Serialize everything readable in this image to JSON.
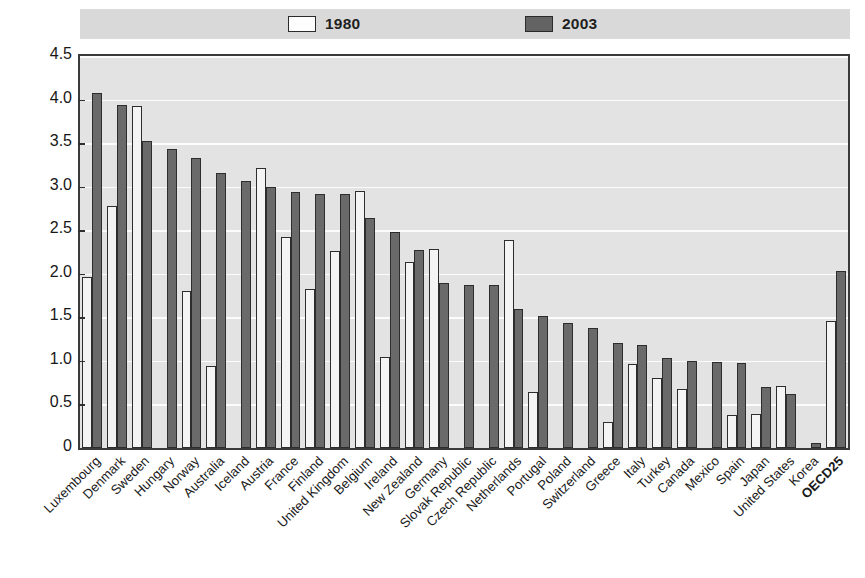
{
  "legend": {
    "entries": [
      {
        "label": "1980",
        "key": "1980",
        "swatch": "legend-swatch-outline",
        "color": "#fdfdfd"
      },
      {
        "label": "2003",
        "key": "2003",
        "swatch": "legend-swatch-filled",
        "color": "#636363"
      }
    ]
  },
  "chart_data": {
    "type": "bar",
    "title": "",
    "subtitle": "",
    "xlabel": "",
    "ylabel": "",
    "ylim": [
      0,
      4.5
    ],
    "yticks": [
      "0",
      "0.5",
      "1.0",
      "1.5",
      "2.0",
      "2.5",
      "3.0",
      "3.5",
      "4.0",
      "4.5"
    ],
    "ytick_values": [
      0,
      0.5,
      1.0,
      1.5,
      2.0,
      2.5,
      3.0,
      3.5,
      4.0,
      4.5
    ],
    "grid": true,
    "grid_axis": "y",
    "legend_position": "top",
    "categories": [
      "Luxembourg",
      "Denmark",
      "Sweden",
      "Hungary",
      "Norway",
      "Australia",
      "Iceland",
      "Austria",
      "France",
      "Finland",
      "United Kingdom",
      "Belgium",
      "Ireland",
      "New Zealand",
      "Germany",
      "Slovak Republic",
      "Czech Republic",
      "Netherlands",
      "Portugal",
      "Poland",
      "Switzerland",
      "Greece",
      "Italy",
      "Turkey",
      "Canada",
      "Mexico",
      "Spain",
      "Japan",
      "United States",
      "Korea",
      "OECD25"
    ],
    "series": [
      {
        "name": "1980",
        "color": "#f4f4f4",
        "values": [
          1.96,
          2.78,
          3.93,
          0.0,
          1.8,
          0.94,
          0.0,
          3.22,
          2.42,
          1.83,
          2.26,
          2.95,
          1.04,
          2.13,
          2.29,
          0.0,
          0.0,
          2.39,
          0.64,
          0.0,
          0.0,
          0.3,
          0.97,
          0.8,
          0.68,
          0.0,
          0.38,
          0.39,
          0.71,
          0.0,
          1.46
        ]
      },
      {
        "name": "2003",
        "color": "#6a6a6a",
        "values": [
          4.08,
          3.94,
          3.53,
          3.43,
          3.33,
          3.16,
          3.06,
          3.0,
          2.94,
          2.92,
          2.92,
          2.64,
          2.48,
          2.27,
          1.89,
          1.87,
          1.87,
          1.6,
          1.52,
          1.44,
          1.38,
          1.2,
          1.18,
          1.03,
          1.0,
          0.99,
          0.98,
          0.7,
          0.62,
          0.06,
          2.03
        ]
      }
    ]
  },
  "axes": {
    "ytick_labels": [
      "4.5",
      "4.0",
      "3.5",
      "3.0",
      "2.5",
      "2.0",
      "1.5",
      "1.0",
      "0.5",
      "0"
    ]
  }
}
